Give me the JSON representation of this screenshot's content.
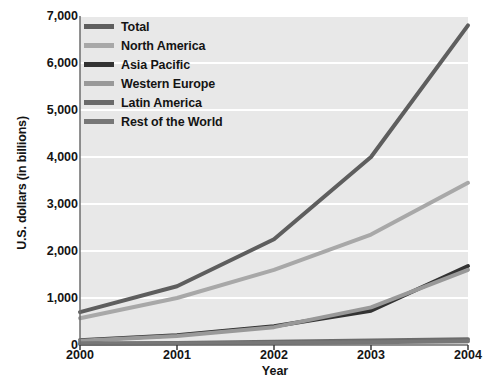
{
  "chart_data": {
    "type": "line",
    "title": "",
    "xlabel": "Year",
    "ylabel": "U.S. dollars (in billions)",
    "categories": [
      "2000",
      "2001",
      "2002",
      "2003",
      "2004"
    ],
    "x": [
      2000,
      2001,
      2002,
      2003,
      2004
    ],
    "xlim": [
      2000,
      2004
    ],
    "ylim": [
      0,
      7000
    ],
    "yticks": [
      0,
      1000,
      2000,
      3000,
      4000,
      5000,
      6000,
      7000
    ],
    "ytick_labels": [
      "0",
      "1,000",
      "2,000",
      "3,000",
      "4,000",
      "5,000",
      "6,000",
      "7,000"
    ],
    "grid": true,
    "legend_position": "top-left",
    "plot_background": "#e8e8e8",
    "gridline_color": "#ffffff",
    "series": [
      {
        "name": "Total",
        "color": "#5e5e5e",
        "values": [
          700,
          1250,
          2250,
          4000,
          6800
        ]
      },
      {
        "name": "North America",
        "color": "#a8a8a8",
        "values": [
          570,
          1000,
          1600,
          2350,
          3450
        ]
      },
      {
        "name": "Asia Pacific",
        "color": "#333333",
        "values": [
          100,
          210,
          400,
          730,
          1680
        ]
      },
      {
        "name": "Western Europe",
        "color": "#999999",
        "values": [
          90,
          190,
          380,
          800,
          1600
        ]
      },
      {
        "name": "Latin America",
        "color": "#6b6b6b",
        "values": [
          30,
          45,
          70,
          95,
          120
        ]
      },
      {
        "name": "Rest of the World",
        "color": "#777777",
        "values": [
          20,
          30,
          45,
          60,
          80
        ]
      }
    ]
  }
}
